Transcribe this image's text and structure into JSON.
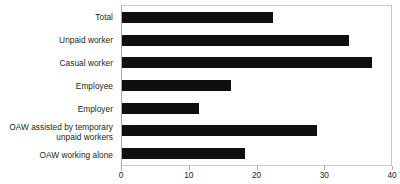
{
  "chart_data": {
    "type": "bar",
    "orientation": "horizontal",
    "title": "",
    "subtitle": "",
    "xlabel": "",
    "ylabel": "",
    "categories": [
      "Total",
      "Unpaid worker",
      "Casual worker",
      "Employee",
      "Employer",
      "OAW assisted by temporary\nunpaid workers",
      "OAW working alone"
    ],
    "values": [
      22.3,
      33.5,
      36.9,
      16.1,
      11.4,
      28.8,
      18.2
    ],
    "xlim": [
      0,
      40
    ],
    "xticks": [
      0,
      10,
      20,
      30,
      40
    ],
    "xtick_labels": [
      "0",
      "10",
      "20",
      "30",
      "40"
    ],
    "grid": false,
    "legend": null,
    "bar_color": "#100f0f",
    "axis_color": "#a8a8a8",
    "plot_border_color": "#c9c9c9",
    "background_color": "#ffffff",
    "text_color": "#231f20"
  }
}
